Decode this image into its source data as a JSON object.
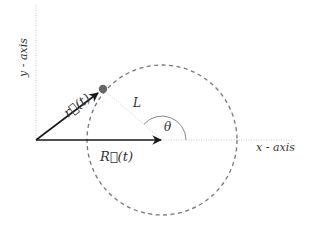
{
  "diagram": {
    "type": "vector-geometry",
    "labels": {
      "x_axis": "x - axis",
      "y_axis": "y - axis",
      "r_vector": "r⃗(t)",
      "R_vector": "R⃗(t)",
      "length": "L",
      "angle": "θ"
    },
    "elements": {
      "origin": {
        "x": 36,
        "y": 140
      },
      "circle": {
        "cx": 162,
        "cy": 140,
        "r": 75,
        "style": "dashed"
      },
      "point": {
        "x": 103,
        "y": 89
      },
      "angle_arc": {
        "r": 24,
        "from_deg": 0,
        "to_deg": 139
      }
    },
    "colors": {
      "vector": "#1a1a1a",
      "circle": "#777777",
      "axis": "#c8c8c8",
      "point": "#666666",
      "length_line": "#cfcfcf",
      "arc": "#888888",
      "text": "#333333"
    }
  }
}
